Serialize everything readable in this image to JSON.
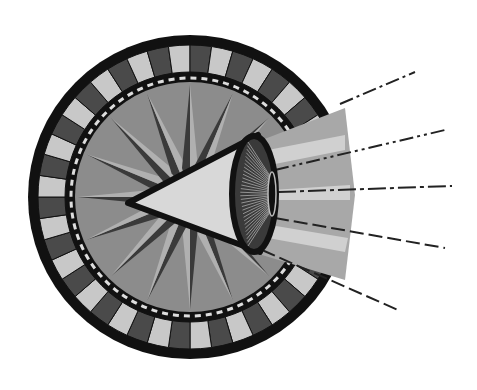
{
  "illustration": {
    "subject": "eye-cone-in-striped-dial",
    "colors": {
      "background": "#ffffff",
      "outline": "#111111",
      "stripe_dark": "#4a4a4a",
      "stripe_light": "#c8c8c8",
      "inner_disc": "#8c8c8c",
      "star_dark": "#3a3a3a",
      "star_light": "#b0b0b0",
      "cone": "#d8d8d8",
      "beam": "#a8a8a8",
      "beam_light": "#d0d0d0"
    }
  }
}
